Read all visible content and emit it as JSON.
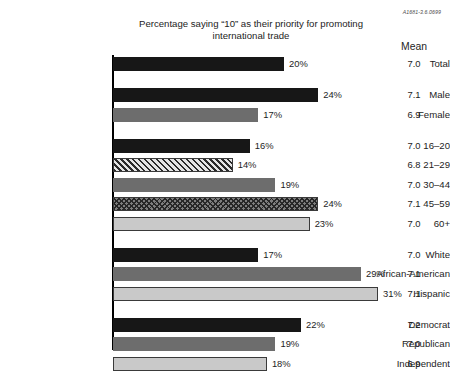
{
  "figure_id": "A1681-3.6.0699",
  "title": "Percentage saying “10” as their priority for promoting international trade",
  "mean_column_header": "Mean",
  "chart_data": {
    "type": "bar",
    "orientation": "horizontal",
    "title": "Percentage saying “10” as their priority for promoting international trade",
    "xlabel": "",
    "ylabel": "",
    "xlim": [
      0,
      35
    ],
    "grid": false,
    "legend": "none",
    "value_suffix": "%",
    "extra_column": {
      "header": "Mean",
      "values": [
        "7.0",
        "7.1",
        "6.9",
        "7.0",
        "6.8",
        "7.0",
        "7.1",
        "7.0",
        "7.0",
        "7.1",
        "7.1",
        "7.2",
        "7.0",
        "6.9"
      ]
    },
    "categories": [
      "Total",
      "Male",
      "Female",
      "16–20",
      "21–29",
      "30–44",
      "45–59",
      "60+",
      "White",
      "African-American",
      "Hispanic",
      "Democrat",
      "Republican",
      "Independent"
    ],
    "values": [
      20,
      24,
      17,
      16,
      14,
      19,
      24,
      23,
      17,
      29,
      31,
      22,
      19,
      18
    ],
    "groups": [
      {
        "name": "overall",
        "rows": [
          {
            "label": "Total",
            "value": 20,
            "value_label": "20%",
            "mean": "7.0",
            "fill": "f-black",
            "outlined": false
          }
        ]
      },
      {
        "name": "gender",
        "rows": [
          {
            "label": "Male",
            "value": 24,
            "value_label": "24%",
            "mean": "7.1",
            "fill": "f-black",
            "outlined": false
          },
          {
            "label": "Female",
            "value": 17,
            "value_label": "17%",
            "mean": "6.9",
            "fill": "f-mid",
            "outlined": false
          }
        ]
      },
      {
        "name": "age",
        "rows": [
          {
            "label": "16–20",
            "value": 16,
            "value_label": "16%",
            "mean": "7.0",
            "fill": "f-black",
            "outlined": false
          },
          {
            "label": "21–29",
            "value": 14,
            "value_label": "14%",
            "mean": "6.8",
            "fill": "f-diag",
            "outlined": true
          },
          {
            "label": "30–44",
            "value": 19,
            "value_label": "19%",
            "mean": "7.0",
            "fill": "f-mid",
            "outlined": false
          },
          {
            "label": "45–59",
            "value": 24,
            "value_label": "24%",
            "mean": "7.1",
            "fill": "f-cross",
            "outlined": true
          },
          {
            "label": "60+",
            "value": 23,
            "value_label": "23%",
            "mean": "7.0",
            "fill": "f-light",
            "outlined": true
          }
        ]
      },
      {
        "name": "race",
        "rows": [
          {
            "label": "White",
            "value": 17,
            "value_label": "17%",
            "mean": "7.0",
            "fill": "f-black",
            "outlined": false
          },
          {
            "label": "African-American",
            "value": 29,
            "value_label": "29%",
            "mean": "7.1",
            "fill": "f-mid",
            "outlined": false
          },
          {
            "label": "Hispanic",
            "value": 31,
            "value_label": "31%",
            "mean": "7.1",
            "fill": "f-light",
            "outlined": true
          }
        ]
      },
      {
        "name": "party",
        "rows": [
          {
            "label": "Democrat",
            "value": 22,
            "value_label": "22%",
            "mean": "7.2",
            "fill": "f-black",
            "outlined": false
          },
          {
            "label": "Republican",
            "value": 19,
            "value_label": "19%",
            "mean": "7.0",
            "fill": "f-mid",
            "outlined": false
          },
          {
            "label": "Independent",
            "value": 18,
            "value_label": "18%",
            "mean": "6.9",
            "fill": "f-light",
            "outlined": true
          }
        ]
      }
    ]
  }
}
